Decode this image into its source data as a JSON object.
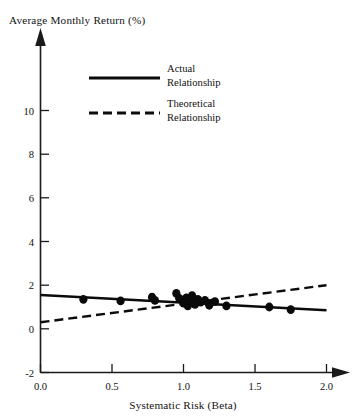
{
  "chart_data": {
    "type": "scatter",
    "title": "",
    "ylabel": "Average Monthly Return (%)",
    "xlabel": "Systematic Risk (Beta)",
    "xlim": [
      0.0,
      2.0
    ],
    "ylim": [
      -2,
      11
    ],
    "grid": false,
    "legend_position": "top-center",
    "x_ticks": [
      "0.0",
      "0.5",
      "1.0",
      "1.5",
      "2.0"
    ],
    "x_tick_values": [
      0.0,
      0.5,
      1.0,
      1.5,
      2.0
    ],
    "y_ticks": [
      "10",
      "8",
      "6",
      "4",
      "2",
      "0",
      "-2"
    ],
    "y_tick_values": [
      10,
      8,
      6,
      4,
      2,
      0,
      -2
    ],
    "legend": [
      {
        "label_line1": "Actual",
        "label_line2": "Relationship",
        "style": "solid"
      },
      {
        "label_line1": "Theoretical",
        "label_line2": "Relationship",
        "style": "dashed"
      }
    ],
    "series": [
      {
        "name": "Actual Relationship",
        "type": "line",
        "style": "solid",
        "x": [
          0.0,
          2.0
        ],
        "y": [
          1.55,
          0.85
        ]
      },
      {
        "name": "Theoretical Relationship",
        "type": "line",
        "style": "dashed",
        "x": [
          0.0,
          2.0
        ],
        "y": [
          0.3,
          2.0
        ]
      },
      {
        "name": "Portfolio observations",
        "type": "scatter",
        "points": [
          {
            "x": 0.3,
            "y": 1.35
          },
          {
            "x": 0.56,
            "y": 1.28
          },
          {
            "x": 0.78,
            "y": 1.45
          },
          {
            "x": 0.8,
            "y": 1.3
          },
          {
            "x": 0.95,
            "y": 1.62
          },
          {
            "x": 0.97,
            "y": 1.4
          },
          {
            "x": 1.0,
            "y": 1.18
          },
          {
            "x": 1.02,
            "y": 1.42
          },
          {
            "x": 1.03,
            "y": 1.05
          },
          {
            "x": 1.05,
            "y": 1.3
          },
          {
            "x": 1.06,
            "y": 1.52
          },
          {
            "x": 1.08,
            "y": 1.12
          },
          {
            "x": 1.1,
            "y": 1.35
          },
          {
            "x": 1.12,
            "y": 1.22
          },
          {
            "x": 1.15,
            "y": 1.3
          },
          {
            "x": 1.18,
            "y": 1.08
          },
          {
            "x": 1.22,
            "y": 1.25
          },
          {
            "x": 1.3,
            "y": 1.05
          },
          {
            "x": 1.6,
            "y": 1.0
          },
          {
            "x": 1.75,
            "y": 0.88
          }
        ]
      }
    ]
  },
  "axes": {
    "y_axis_title": "Average Monthly Return (%)",
    "x_axis_title": "Systematic Risk (Beta)"
  },
  "legend": {
    "actual_line1": "Actual",
    "actual_line2": "Relationship",
    "theoretical_line1": "Theoretical",
    "theoretical_line2": "Relationship"
  },
  "ticks": {
    "y": [
      "10",
      "8",
      "6",
      "4",
      "2",
      "0",
      "-2"
    ],
    "x": [
      "0.0",
      "0.5",
      "1.0",
      "1.5",
      "2.0"
    ]
  },
  "colors": {
    "ink": "#0b0b0b",
    "axis": "#1a1a1a",
    "background": "#ffffff"
  }
}
